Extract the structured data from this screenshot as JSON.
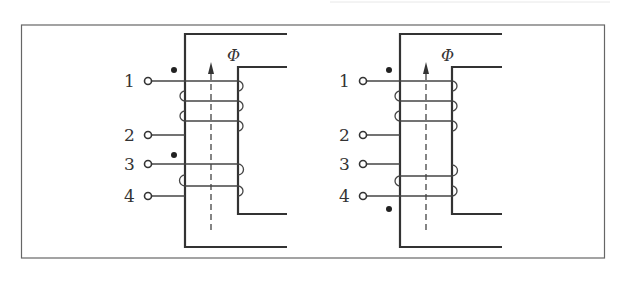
{
  "figure": {
    "flux_symbol": "Φ",
    "panels": [
      {
        "id": "left",
        "terminals": [
          "1",
          "2",
          "3",
          "4"
        ],
        "windings": [
          {
            "from": "1",
            "to": "2",
            "turns": 3,
            "dot_at": "1"
          },
          {
            "from": "3",
            "to": "4",
            "turns": 2,
            "dot_at": "3"
          }
        ]
      },
      {
        "id": "right",
        "terminals": [
          "1",
          "2",
          "3",
          "4"
        ],
        "windings": [
          {
            "from": "1",
            "to": "2",
            "turns": 3,
            "dot_at": "1"
          },
          {
            "from": "3",
            "to": "4",
            "turns": 2,
            "dot_at": "4"
          }
        ]
      }
    ]
  }
}
